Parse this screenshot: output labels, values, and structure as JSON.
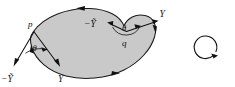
{
  "figure": {
    "background_color": "#ffffff",
    "region": {
      "name": "heart-shaped-region",
      "fill_color": "#c9c9c9",
      "outline_color": "#1b1b1b",
      "orientation": "boundary arrows: leftward along the top edge, rightward along the bottom edge"
    },
    "points": [
      {
        "id": "p",
        "label": "p",
        "position": "left cusp of the region"
      },
      {
        "id": "q",
        "label": "q",
        "position": "upper notch of the region"
      }
    ],
    "vectors": [
      {
        "id": "p-minus-y-tilde",
        "label": "−Ỹ",
        "at_point": "p",
        "direction": "down-left, outward"
      },
      {
        "id": "p-y",
        "label": "Y",
        "at_point": "p",
        "direction": "down-right, outward"
      },
      {
        "id": "q-minus-y-tilde",
        "label": "−Ỹ",
        "at_point": "q",
        "direction": "left, into the region"
      },
      {
        "id": "q-y",
        "label": "Y",
        "at_point": "q",
        "direction": "up-right, outward"
      }
    ],
    "angles": [
      {
        "id": "theta-at-p",
        "label": "θ",
        "between": [
          "−Ỹ",
          "Y"
        ],
        "at_point": "p"
      },
      {
        "id": "theta-at-q",
        "label": "θ",
        "between": [
          "−Ỹ",
          "Y"
        ],
        "at_point": "q"
      }
    ],
    "orientation_indicator": {
      "name": "orientation-circle",
      "shape": "circle with single arrowhead",
      "sense": "clockwise",
      "arrow_position": "lower-right of circle"
    }
  }
}
